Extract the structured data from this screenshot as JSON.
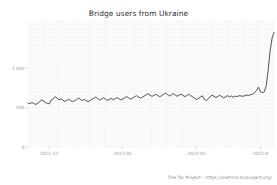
{
  "chart_data": {
    "type": "line",
    "title": "Bridge users from Ukraine",
    "xlabel": "",
    "ylabel": "",
    "ylim": [
      0,
      1600
    ],
    "yticks": [
      0,
      500,
      1000
    ],
    "ytick_labels": [
      "0",
      "500",
      "1 000"
    ],
    "grid": true,
    "legend": null,
    "line_color": "#333333",
    "background_color": "#fafafa",
    "xticks": [
      "2021-12",
      "2022-01",
      "2022-02",
      "2022-0"
    ],
    "xtick_positions": [
      0.085,
      0.385,
      0.685,
      0.945
    ],
    "x_start": "2021-11-20",
    "x_end": "2022-03-06",
    "series": [
      {
        "name": "Bridge users from Ukraine",
        "values": [
          560,
          548,
          566,
          552,
          540,
          556,
          572,
          600,
          584,
          566,
          552,
          548,
          598,
          612,
          640,
          622,
          600,
          612,
          596,
          578,
          592,
          606,
          590,
          576,
          588,
          600,
          622,
          606,
          590,
          604,
          588,
          576,
          590,
          604,
          620,
          634,
          612,
          596,
          610,
          626,
          608,
          592,
          604,
          618,
          600,
          614,
          628,
          612,
          598,
          612,
          626,
          640,
          624,
          608,
          622,
          638,
          652,
          636,
          620,
          634,
          648,
          662,
          676,
          658,
          642,
          656,
          670,
          654,
          638,
          652,
          668,
          684,
          666,
          648,
          662,
          678,
          660,
          644,
          658,
          672,
          656,
          640,
          654,
          670,
          652,
          636,
          620,
          604,
          618,
          634,
          650,
          606,
          590,
          612,
          636,
          660,
          644,
          628,
          642,
          656,
          640,
          624,
          638,
          652,
          636,
          648,
          632,
          646,
          640,
          652,
          648,
          644,
          652,
          660,
          656,
          664,
          670,
          690,
          720,
          760,
          700,
          690,
          700,
          780,
          980,
          1220,
          1380,
          1455
        ]
      }
    ],
    "annotations": [
      {
        "text": "The Tor Project - https://metrics.torproject.org/",
        "position": "bottom-right"
      }
    ]
  },
  "footer": {
    "credit": "The Tor Project - https://metrics.torproject.org/"
  }
}
